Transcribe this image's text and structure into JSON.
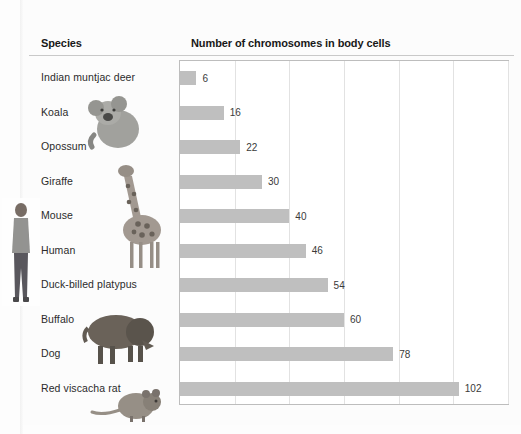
{
  "headers": {
    "species": "Species",
    "chart": "Number of chromosomes in body cells"
  },
  "colors": {
    "bar_fill": "#bfbfbf",
    "gridline": "#e2e2e2",
    "plot_border": "#bdbdbd",
    "label_text": "#2b2b2b",
    "header_text": "#181818",
    "page_background": "#fcfcfc"
  },
  "photos": [
    {
      "name": "human-photo",
      "alt": "Human standing"
    },
    {
      "name": "koala-photo",
      "alt": "Koala"
    },
    {
      "name": "giraffe-photo",
      "alt": "Giraffe"
    },
    {
      "name": "buffalo-photo",
      "alt": "Buffalo"
    },
    {
      "name": "rat-photo",
      "alt": "Red viscacha rat"
    }
  ],
  "chart_data": {
    "type": "bar",
    "orientation": "horizontal",
    "title": "Number of chromosomes in body cells",
    "xlabel": "",
    "ylabel": "Species",
    "categories": [
      "Indian muntjac deer",
      "Koala",
      "Opossum",
      "Giraffe",
      "Mouse",
      "Human",
      "Duck-billed platypus",
      "Buffalo",
      "Dog",
      "Red viscacha rat"
    ],
    "values": [
      6,
      16,
      22,
      30,
      40,
      46,
      54,
      60,
      78,
      102
    ],
    "data_labels": [
      "6",
      "16",
      "22",
      "30",
      "40",
      "46",
      "54",
      "60",
      "78",
      "102"
    ],
    "xlim": [
      0,
      120
    ],
    "gridline_values": [
      20,
      40,
      60,
      80,
      100,
      120
    ],
    "grid": true,
    "legend": false
  }
}
